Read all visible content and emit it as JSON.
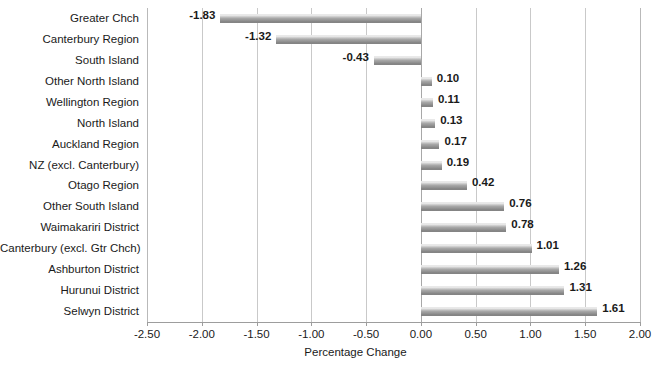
{
  "chart_data": {
    "type": "bar",
    "orientation": "horizontal",
    "title": "",
    "xlabel": "Percentage Change",
    "ylabel": "",
    "xlim": [
      -2.5,
      2.0
    ],
    "xticks": [
      "-2.50",
      "-2.00",
      "-1.50",
      "-1.00",
      "-0.50",
      "0.00",
      "0.50",
      "1.00",
      "1.50",
      "2.00"
    ],
    "xtick_values": [
      -2.5,
      -2.0,
      -1.5,
      -1.0,
      -0.5,
      0.0,
      0.5,
      1.0,
      1.5,
      2.0
    ],
    "grid": true,
    "legend": false,
    "categories": [
      "Greater Chch",
      "Canterbury Region",
      "South Island",
      "Other North Island",
      "Wellington Region",
      "North Island",
      "Auckland Region",
      "NZ (excl. Canterbury)",
      "Otago Region",
      "Other South Island",
      "Waimakariri District",
      "Canterbury (excl. Gtr Chch)",
      "Ashburton District",
      "Hurunui District",
      "Selwyn District"
    ],
    "values": [
      -1.83,
      -1.32,
      -0.43,
      0.1,
      0.11,
      0.13,
      0.17,
      0.19,
      0.42,
      0.76,
      0.78,
      1.01,
      1.26,
      1.31,
      1.61
    ],
    "data_labels": [
      "-1.83",
      "-1.32",
      "-0.43",
      "0.10",
      "0.11",
      "0.13",
      "0.17",
      "0.19",
      "0.42",
      "0.76",
      "0.78",
      "1.01",
      "1.26",
      "1.31",
      "1.61"
    ],
    "bar_color": "#8f8f8f",
    "gridline_color": "#c9c9c9",
    "axis_color": "#9d9d9d",
    "text_color": "#1a1a1a",
    "background_color": "#ffffff"
  }
}
